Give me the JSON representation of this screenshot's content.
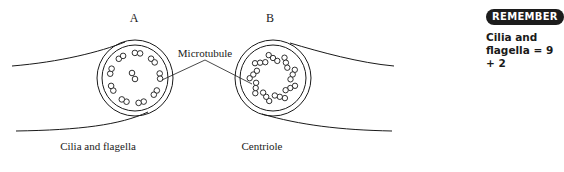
{
  "diagram": {
    "label_a": "A",
    "label_b": "B",
    "caption_a": "Cilia and flagella",
    "caption_b": "Centriole",
    "pointer_label": "Microtubule"
  },
  "sidebar": {
    "badge": "REMEMBER",
    "note_line1": "Cilia and",
    "note_line2": "flagella = 9 + 2"
  }
}
